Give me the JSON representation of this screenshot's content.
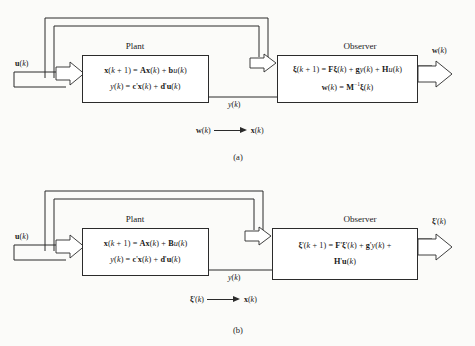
{
  "figure": {
    "type": "block-diagram",
    "panels": [
      {
        "caption": "(a)",
        "input_label": "u(k)",
        "plant": {
          "title": "Plant",
          "equations": [
            "x(k + 1) = Ax(k) + bu(k)",
            "y(k) = c'x(k) + d'u(k)"
          ]
        },
        "observer": {
          "title": "Observer",
          "equations": [
            "ξ(k + 1) = Fξ(k) + gy(k) + Hu(k)",
            "w(k) = M⁻¹ξ(k)"
          ]
        },
        "middle_signal": "y(k)",
        "output_label": "w(k)",
        "note": {
          "from": "w(k)",
          "arrow": "⟶",
          "to": "x(k)"
        }
      },
      {
        "caption": "(b)",
        "input_label": "u(k)",
        "plant": {
          "title": "Plant",
          "equations": [
            "x(k + 1) = Ax(k) + Bu(k)",
            "y(k) = c'x(k) + d'u(k)"
          ]
        },
        "observer": {
          "title": "Observer",
          "equations": [
            "ξ'(k + 1) = F'ξ'(k) + g'y(k) +",
            "H'u(k)"
          ]
        },
        "middle_signal": "y(k)",
        "output_label": "ξ'(k)",
        "note": {
          "from": "ξ'(k)",
          "arrow": "⟶",
          "to": "x(k)"
        }
      }
    ],
    "colors": {
      "ink": "#2b2b2b",
      "paper": "#fbfbf9",
      "box_fill": "#ffffff"
    }
  }
}
